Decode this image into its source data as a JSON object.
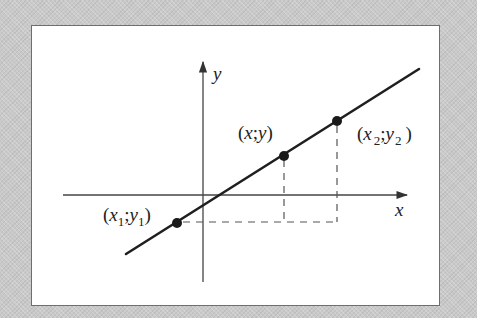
{
  "diagram": {
    "title": "",
    "colors": {
      "background": "#c9c9c9",
      "panel": "#ffffff",
      "panel_border": "#6e6e6e",
      "line": "#1f1f1f",
      "axes": "#444444",
      "dashes": "#555555",
      "points": "#1a1a1a"
    },
    "axes": {
      "x_label": "x",
      "y_label": "y"
    },
    "points": [
      {
        "id": "p1",
        "label_open": "(",
        "var_x": "x",
        "sub_x": "1",
        "sep": ";",
        "var_y": "y",
        "sub_y": "1",
        "label_close": ")"
      },
      {
        "id": "p",
        "label_open": "(",
        "var_x": "x",
        "sep": ";",
        "var_y": "y",
        "label_close": ")"
      },
      {
        "id": "p2",
        "label_open": "(",
        "var_x": "x",
        "sub_x": "2",
        "sep": ";",
        "var_y": "y",
        "sub_y": "2",
        "label_close": ")"
      }
    ]
  }
}
